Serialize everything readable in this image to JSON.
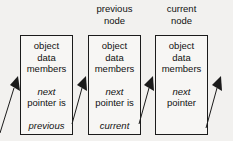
{
  "diagram": {
    "background_color": "#f2f1ef",
    "box_border_color": "#1b1b1b",
    "box_fill_color": "#f7f6f4",
    "text_color": "#111111",
    "headers": [
      {
        "id": "previous-node",
        "line1": "previous",
        "line2": "node"
      },
      {
        "id": "current-node",
        "line1": "current",
        "line2": "node"
      }
    ],
    "nodes": [
      {
        "id": "node-1",
        "members_line1": "object",
        "members_line2": "data",
        "members_line3": "members",
        "pointer_line1": "next",
        "pointer_line2": "pointer is",
        "target": "previous"
      },
      {
        "id": "node-2",
        "members_line1": "object",
        "members_line2": "data",
        "members_line3": "members",
        "pointer_line1": "next",
        "pointer_line2": "pointer is",
        "target": "current"
      },
      {
        "id": "node-3",
        "members_line1": "object",
        "members_line2": "data",
        "members_line3": "members",
        "pointer_line1": "next",
        "pointer_line2": "pointer",
        "target": ""
      }
    ],
    "arrows": [
      {
        "id": "arrow-into-node-1",
        "from": "offscreen-lower-left",
        "to": "node-1"
      },
      {
        "id": "arrow-node-1-to-node-2",
        "from": "node-1",
        "to": "node-2"
      },
      {
        "id": "arrow-node-2-to-node-3",
        "from": "node-2",
        "to": "node-3"
      },
      {
        "id": "arrow-node-3-to-next",
        "from": "node-3",
        "to": "offscreen-upper-right"
      }
    ]
  }
}
